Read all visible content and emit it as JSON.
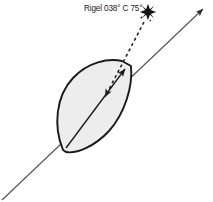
{
  "diagram": {
    "background_color": "#ffffff",
    "annotation": {
      "label": "Rigel 038° C 75°",
      "star_name": "Rigel",
      "compass_bearing": "038°",
      "compass_marker": "C",
      "altitude": "75°",
      "text_color": "#1a1a1a"
    },
    "star": {
      "name": "star-burst",
      "color": "#151515",
      "center_x": 148,
      "center_y": 12,
      "outer_radius": 8,
      "inner_radius": 2.6,
      "points": 8
    },
    "heading_line": {
      "name": "ships-heading-line",
      "color": "#4a4a4a",
      "stroke_width": 1.1,
      "x1": 2,
      "y1": 200,
      "x2": 206,
      "y2": 6,
      "arrow_at": "top-right"
    },
    "bearing_line": {
      "name": "bearing-to-star-line",
      "color": "#1f1f1f",
      "stroke_width": 1.6,
      "dash": "3 3",
      "x1": 145,
      "y1": 20,
      "x2": 104,
      "y2": 99,
      "arrow_at": "lower-end"
    },
    "hull": {
      "name": "ship-hull-outline",
      "fill": "#ededed",
      "stroke": "#1a1a1a",
      "stroke_width": 1.9,
      "shape": "lens"
    },
    "bow_arrow": {
      "name": "bow-direction-arrow",
      "color": "#1a1a1a",
      "stroke_width": 1.4
    }
  }
}
